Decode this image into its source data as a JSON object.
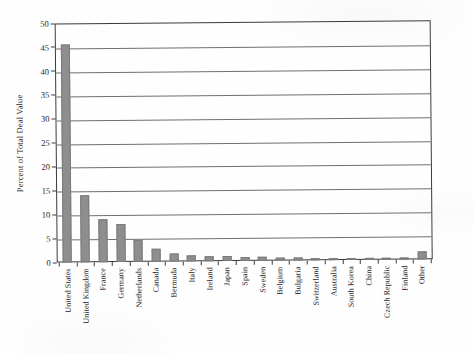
{
  "chart_data": {
    "type": "bar",
    "title": "",
    "xlabel": "",
    "ylabel": "Percent of Total Deal Value",
    "ylim": [
      0,
      50
    ],
    "ytick_step": 5,
    "yticks": [
      50,
      45,
      40,
      35,
      30,
      25,
      20,
      15,
      10,
      5,
      0
    ],
    "ytick_labels": [
      "50",
      "45",
      "40",
      "35",
      "30",
      "25",
      "20",
      "15",
      "10",
      "5",
      "0"
    ],
    "grid": "horizontal",
    "legend": "none",
    "bar_color": "#8e8e8e",
    "axis_color": "#3b3b3b",
    "background_color": "#fefefe",
    "categories": [
      "United States",
      "United Kingdom",
      "France",
      "Germany",
      "Netherlands",
      "Canada",
      "Bermuda",
      "Italy",
      "Ireland",
      "Japan",
      "Spain",
      "Sweden",
      "Belgium",
      "Bulgaria",
      "Switzerland",
      "Australia",
      "South Korea",
      "China",
      "Czech Republic",
      "Finland",
      "Other"
    ],
    "values": [
      45.7,
      14.0,
      9.0,
      8.0,
      4.6,
      2.7,
      1.6,
      1.3,
      1.1,
      1.0,
      0.9,
      0.8,
      0.7,
      0.6,
      0.5,
      0.45,
      0.4,
      0.35,
      0.3,
      0.25,
      1.7
    ]
  }
}
